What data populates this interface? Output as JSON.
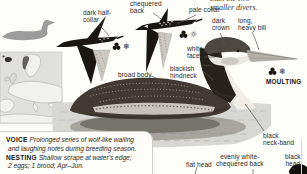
{
  "intro": {
    "clipped_line": "than the two",
    "line2": "smaller divers."
  },
  "labels": {
    "dark_half_collar": [
      "dark half-",
      "collar"
    ],
    "chequered_back": [
      "chequered",
      "back"
    ],
    "pale_collar": "pale collar",
    "dark_crown": [
      "dark",
      "crown"
    ],
    "long_heavy_bill": [
      "long,",
      "heavy bill"
    ],
    "white_face": [
      "white",
      "face"
    ],
    "blackish_hindneck": [
      "blackish",
      "hindneck"
    ],
    "broad_body": "broad body",
    "moulting": "MOULTING",
    "black_neck_band": [
      "black",
      "neck-band"
    ],
    "flat_head": "flat head",
    "evenly_white_chequered_back": [
      "evenly white-",
      "chequered back"
    ],
    "black_head": [
      "black",
      "head"
    ]
  },
  "icons": {
    "plumage_trefoil": "black-trefoil",
    "winter_glyph": "❄",
    "summer_glyph": "☼"
  },
  "facts_panel": {
    "rows": [
      {
        "label": "VOICE",
        "text": "Prolonged series of wolf-like wailing"
      },
      {
        "label": "",
        "text": "and laughing notes during breeding season."
      },
      {
        "label": "NESTING",
        "text": "Shallow scrape at water's edge;"
      },
      {
        "label": "",
        "text": "2 eggs; 1 brood; Apr–Jun."
      }
    ]
  },
  "colors": {
    "ink": "#1a1713",
    "silhouette_gray": "#9c9c9c",
    "map_sea": "#e0e0dc",
    "breeding_range_dark": "#37342f",
    "water_gray": "#d7d7d3"
  }
}
